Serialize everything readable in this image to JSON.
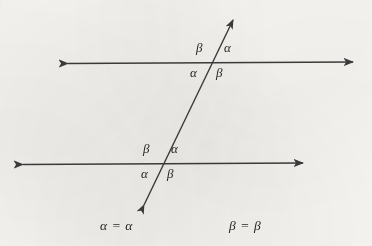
{
  "figure": {
    "stroke_color": "#3a3a3a",
    "text_color": "#262626",
    "background_color": "#f7f6f3",
    "canvas": {
      "width": 372,
      "height": 246
    }
  },
  "lines": {
    "upper_parallel": {
      "name": "upper parallel line",
      "x1": 68,
      "y1": 63.5,
      "x2": 353,
      "y2": 62,
      "arrowheads": "both"
    },
    "lower_parallel": {
      "name": "lower parallel line",
      "x1": 23,
      "y1": 164.5,
      "x2": 303,
      "y2": 163,
      "arrowheads": "both"
    },
    "transversal": {
      "name": "transversal line",
      "x1": 144,
      "y1": 205,
      "x2": 233,
      "y2": 20,
      "arrowheads": "both"
    }
  },
  "intersections": {
    "upper": {
      "x": 211,
      "y": 63
    },
    "lower": {
      "x": 165,
      "y": 164
    }
  },
  "angles": {
    "upper_intersection": [
      {
        "id": "upper-top-left",
        "symbol": "β",
        "x": 196,
        "y": 41
      },
      {
        "id": "upper-top-right",
        "symbol": "α",
        "x": 224,
        "y": 41
      },
      {
        "id": "upper-bottom-left",
        "symbol": "α",
        "x": 190,
        "y": 66
      },
      {
        "id": "upper-bottom-right",
        "symbol": "β",
        "x": 216,
        "y": 66
      }
    ],
    "lower_intersection": [
      {
        "id": "lower-top-left",
        "symbol": "β",
        "x": 143,
        "y": 142
      },
      {
        "id": "lower-top-right",
        "symbol": "α",
        "x": 171,
        "y": 142
      },
      {
        "id": "lower-bottom-left",
        "symbol": "α",
        "x": 141,
        "y": 167
      },
      {
        "id": "lower-bottom-right",
        "symbol": "β",
        "x": 167,
        "y": 167
      }
    ]
  },
  "captions": [
    {
      "id": "alpha-equality",
      "text": "α = α",
      "x": 100,
      "y": 219
    },
    {
      "id": "beta-equality",
      "text": "β = β",
      "x": 229,
      "y": 219
    }
  ]
}
